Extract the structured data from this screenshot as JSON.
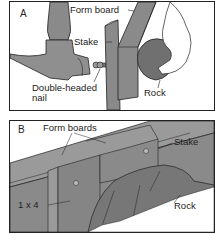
{
  "panel_a": {
    "letter": "A",
    "labels": {
      "form_board": "Form board",
      "stake": "Stake",
      "nail_line1": "Double-headed",
      "nail_line2": "nail",
      "rock": "Rock"
    }
  },
  "panel_b": {
    "letter": "B",
    "labels": {
      "form_boards": "Form boards",
      "stake": "Stake",
      "one_by_four": "1 x 4",
      "rock": "Rock"
    }
  },
  "colors": {
    "wood": "#8a8a8a",
    "wood_dark": "#6e6e6e",
    "rock": "#707070",
    "outline": "#222222"
  }
}
